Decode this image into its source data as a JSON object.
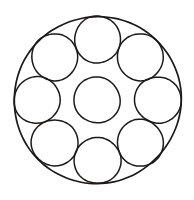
{
  "figure": {
    "canvas": {
      "width": 194,
      "height": 200
    },
    "background_color": "#ffffff",
    "stroke_color": "#1c1a19",
    "fill": "none"
  },
  "chart_data": {
    "type": "diagram",
    "subtype": "circle-packing",
    "title": "",
    "xlabel": "",
    "ylabel": "",
    "grid": false,
    "legend": null,
    "annotations": [],
    "counts": {
      "outer_circles": 1,
      "satellite_circles": 8,
      "center_circles": 1,
      "total_circles": 10
    },
    "geometry_notes": "Eight congruent satellite circles of radius 23 are spaced at 45 degree intervals on an orbit of radius 60.5 about the centre; each satellite is internally tangent to the outer circle of radius 83.5 and tangent to its neighbours. A tenth congruent circle of radius 23 sits at the centre.",
    "circles": [
      {
        "name": "outer-boundary-circle",
        "role": "boundary",
        "cx": 97.5,
        "cy": 100.0,
        "r": 83.5,
        "angle_deg": null,
        "stroke_width": 1.7
      },
      {
        "name": "center-circle",
        "role": "center",
        "cx": 97.0,
        "cy": 100.0,
        "r": 23.0,
        "angle_deg": null,
        "stroke_width": 1.5
      },
      {
        "name": "satellite-circle-top",
        "role": "satellite",
        "cx": 97.5,
        "cy": 39.5,
        "r": 23.2,
        "angle_deg": 90,
        "stroke_width": 1.5
      },
      {
        "name": "satellite-circle-top-right",
        "role": "satellite",
        "cx": 140.3,
        "cy": 57.2,
        "r": 23.2,
        "angle_deg": 45,
        "stroke_width": 1.5
      },
      {
        "name": "satellite-circle-right",
        "role": "satellite",
        "cx": 158.0,
        "cy": 100.0,
        "r": 23.2,
        "angle_deg": 0,
        "stroke_width": 1.5
      },
      {
        "name": "satellite-circle-bottom-right",
        "role": "satellite",
        "cx": 140.3,
        "cy": 142.8,
        "r": 23.2,
        "angle_deg": 315,
        "stroke_width": 1.5
      },
      {
        "name": "satellite-circle-bottom",
        "role": "satellite",
        "cx": 97.5,
        "cy": 160.5,
        "r": 23.2,
        "angle_deg": 270,
        "stroke_width": 1.5
      },
      {
        "name": "satellite-circle-bottom-left",
        "role": "satellite",
        "cx": 54.7,
        "cy": 142.8,
        "r": 23.2,
        "angle_deg": 225,
        "stroke_width": 1.5
      },
      {
        "name": "satellite-circle-left",
        "role": "satellite",
        "cx": 37.0,
        "cy": 100.0,
        "r": 23.2,
        "angle_deg": 180,
        "stroke_width": 1.5
      },
      {
        "name": "satellite-circle-top-left",
        "role": "satellite",
        "cx": 54.7,
        "cy": 57.2,
        "r": 23.2,
        "angle_deg": 135,
        "stroke_width": 1.5
      }
    ]
  }
}
